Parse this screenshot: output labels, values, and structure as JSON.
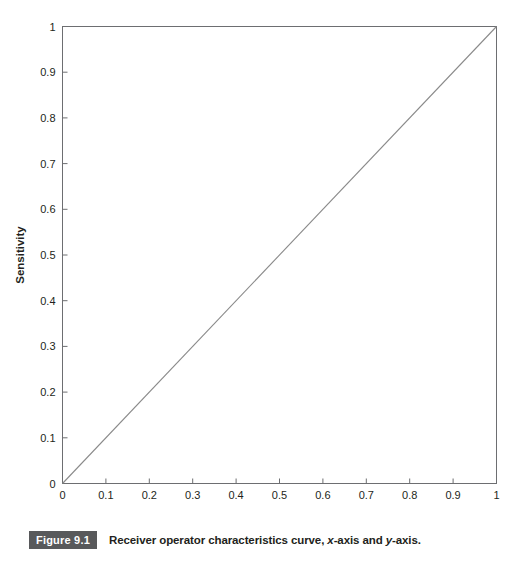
{
  "figure": {
    "badge_label": "Figure 9.1",
    "caption_prefix": "Receiver operator characteristics curve, ",
    "caption_italic_x": "x",
    "caption_mid": "-axis and ",
    "caption_italic_y": "y",
    "caption_suffix": "-axis.",
    "caption_full": "Receiver operator characteristics curve, x-axis and y-axis.",
    "badge_bg_color": "#58595b",
    "badge_text_color": "#ffffff",
    "text_color": "#231f20"
  },
  "chart_data": {
    "type": "line",
    "title": "",
    "subtitle": "",
    "xlabel": "False-positive rate (1-specificity)",
    "ylabel": "Sensitivity",
    "xlim": [
      0,
      1
    ],
    "ylim": [
      0,
      1
    ],
    "grid": false,
    "legend": "none",
    "line_color": "#8a8a8a",
    "axis_color": "#6d6e71",
    "background": "#ffffff",
    "xticks": [
      "0",
      "0.1",
      "0.2",
      "0.3",
      "0.4",
      "0.5",
      "0.6",
      "0.7",
      "0.8",
      "0.9",
      "1"
    ],
    "xtick_values": [
      0,
      0.1,
      0.2,
      0.3,
      0.4,
      0.5,
      0.6,
      0.7,
      0.8,
      0.9,
      1
    ],
    "yticks": [
      "0",
      "0.1",
      "0.2",
      "0.3",
      "0.4",
      "0.5",
      "0.6",
      "0.7",
      "0.8",
      "0.9",
      "1"
    ],
    "ytick_values": [
      0,
      0.1,
      0.2,
      0.3,
      0.4,
      0.5,
      0.6,
      0.7,
      0.8,
      0.9,
      1
    ],
    "series": [
      {
        "name": "reference diagonal",
        "x": [
          0,
          1
        ],
        "values": [
          0,
          1
        ]
      }
    ]
  }
}
